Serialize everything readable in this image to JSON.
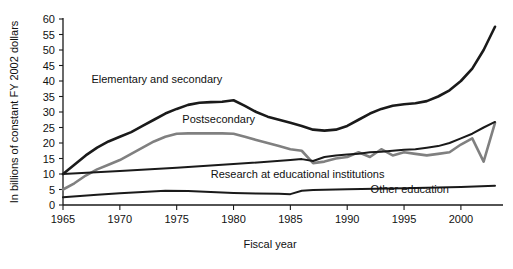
{
  "chart_data": {
    "type": "line",
    "title": "",
    "xlabel": "Fiscal year",
    "ylabel": "In billions of constant FY 2002 dollars",
    "xlim": [
      1965,
      2003
    ],
    "ylim": [
      0,
      60
    ],
    "grid": false,
    "legend_position": "inline-labels",
    "xticks": [
      1965,
      1970,
      1975,
      1980,
      1985,
      1990,
      1995,
      2000
    ],
    "xtick_labels": [
      "1965",
      "1970",
      "1975",
      "1980",
      "1985",
      "1990",
      "1995",
      "2000"
    ],
    "yticks": [
      0,
      5,
      10,
      15,
      20,
      25,
      30,
      35,
      40,
      45,
      50,
      55,
      60
    ],
    "ytick_labels": [
      "0",
      "5",
      "10",
      "15",
      "20",
      "25",
      "30",
      "35",
      "40",
      "45",
      "50",
      "55",
      "60"
    ],
    "series": [
      {
        "name": "Elementary and secondary",
        "color": "#1a1a1a",
        "width": 2.6,
        "label_x": 1967.5,
        "label_y": 39.5,
        "x": [
          1965,
          1966,
          1967,
          1968,
          1969,
          1970,
          1971,
          1972,
          1973,
          1974,
          1975,
          1976,
          1977,
          1978,
          1979,
          1980,
          1981,
          1982,
          1983,
          1984,
          1985,
          1986,
          1987,
          1988,
          1989,
          1990,
          1991,
          1992,
          1993,
          1994,
          1995,
          1996,
          1997,
          1998,
          1999,
          2000,
          2001,
          2002,
          2003
        ],
        "y": [
          10.0,
          13.0,
          16.0,
          18.5,
          20.5,
          22.0,
          23.5,
          25.5,
          27.5,
          29.5,
          31.0,
          32.3,
          33.0,
          33.2,
          33.3,
          33.8,
          32.0,
          30.0,
          28.5,
          27.5,
          26.5,
          25.5,
          24.3,
          24.0,
          24.3,
          25.5,
          27.5,
          29.5,
          31.0,
          32.0,
          32.5,
          32.8,
          33.5,
          35.0,
          37.0,
          40.0,
          44.0,
          50.0,
          57.5
        ]
      },
      {
        "name": "Postsecondary",
        "color": "#808080",
        "width": 2.6,
        "label_x": 1975.5,
        "label_y": 26.5,
        "x": [
          1965,
          1966,
          1967,
          1968,
          1969,
          1970,
          1971,
          1972,
          1973,
          1974,
          1975,
          1976,
          1977,
          1978,
          1979,
          1980,
          1981,
          1982,
          1983,
          1984,
          1985,
          1986,
          1987,
          1988,
          1989,
          1990,
          1991,
          1992,
          1993,
          1994,
          1995,
          1996,
          1997,
          1998,
          1999,
          2000,
          2001,
          2002,
          2003
        ],
        "y": [
          5.0,
          7.0,
          9.5,
          11.5,
          13.0,
          14.5,
          16.5,
          18.5,
          20.5,
          22.0,
          23.0,
          23.1,
          23.1,
          23.1,
          23.1,
          23.0,
          22.0,
          21.0,
          20.0,
          19.0,
          18.0,
          17.5,
          13.5,
          14.0,
          15.0,
          15.5,
          17.0,
          15.5,
          18.0,
          16.0,
          17.0,
          16.5,
          16.0,
          16.5,
          17.0,
          19.5,
          21.5,
          14.0,
          26.5
        ]
      },
      {
        "name": "Research at educational institutions",
        "color": "#1a1a1a",
        "width": 2.0,
        "label_x": 1978.0,
        "label_y": 8.8,
        "x": [
          1965,
          1970,
          1975,
          1980,
          1985,
          1986,
          1987,
          1988,
          1989,
          1990,
          1991,
          1992,
          1993,
          1994,
          1995,
          1996,
          1997,
          1998,
          1999,
          2000,
          2001,
          2002,
          2003
        ],
        "y": [
          10.0,
          11.0,
          12.0,
          13.2,
          14.5,
          14.8,
          14.2,
          15.5,
          16.0,
          16.3,
          16.5,
          17.0,
          17.2,
          17.5,
          17.8,
          18.0,
          18.5,
          19.0,
          20.0,
          21.5,
          23.0,
          25.0,
          26.8
        ]
      },
      {
        "name": "Other education",
        "color": "#1a1a1a",
        "width": 2.0,
        "label_x": 1995.5,
        "label_y": 4.0,
        "x": [
          1965,
          1968,
          1970,
          1972,
          1974,
          1976,
          1978,
          1980,
          1982,
          1984,
          1985,
          1986,
          1987,
          1990,
          1995,
          2000,
          2003
        ],
        "y": [
          2.5,
          3.3,
          3.8,
          4.2,
          4.6,
          4.5,
          4.2,
          3.9,
          3.7,
          3.6,
          3.5,
          4.6,
          4.8,
          5.1,
          5.4,
          5.8,
          6.2
        ]
      }
    ]
  }
}
